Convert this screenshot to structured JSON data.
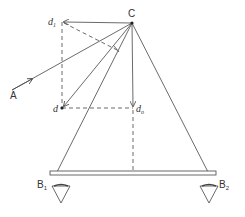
{
  "diagram": {
    "labels": {
      "C": "C",
      "A": "A",
      "d": "d",
      "d1_base": "d",
      "d1_sub": "1",
      "d0_base": "d",
      "d0_sub": "o",
      "B1_base": "B",
      "B1_sub": "1",
      "B2_base": "B",
      "B2_sub": "2"
    },
    "colors": {
      "stroke": "#444444",
      "background": "#ffffff"
    }
  }
}
